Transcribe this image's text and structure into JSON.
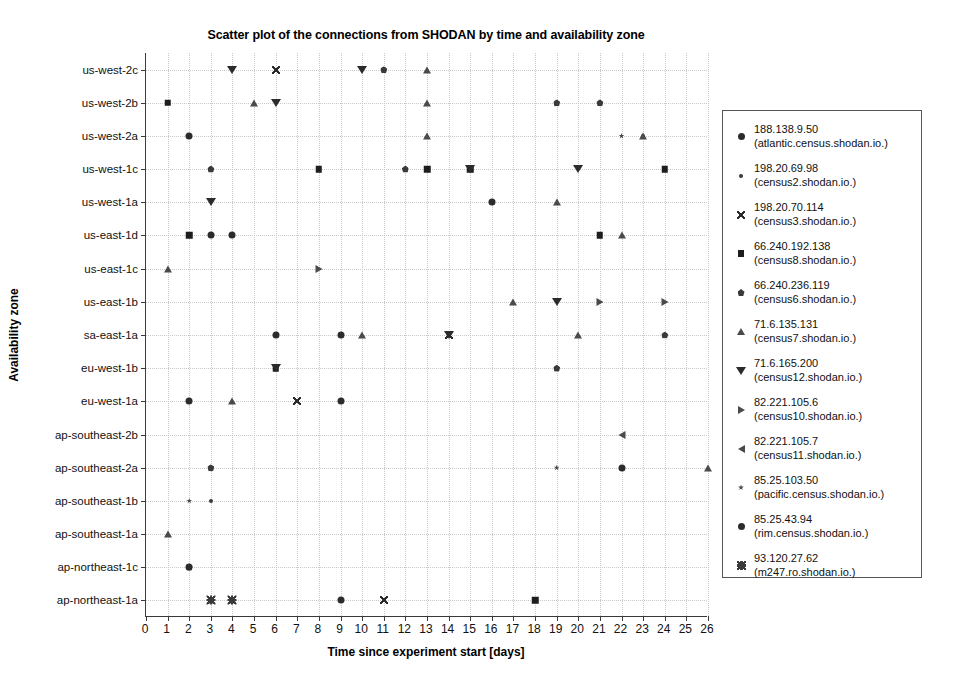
{
  "chart_data": {
    "type": "scatter",
    "title": "Scatter plot of the connections from SHODAN by time and availability zone",
    "xlabel": "Time since experiment start [days]",
    "ylabel": "Availability zone",
    "xlim": [
      0,
      26
    ],
    "xticks": [
      "0",
      "1",
      "2",
      "3",
      "4",
      "5",
      "6",
      "7",
      "8",
      "9",
      "10",
      "11",
      "12",
      "13",
      "14",
      "15",
      "16",
      "17",
      "18",
      "19",
      "20",
      "21",
      "22",
      "23",
      "24",
      "25",
      "26"
    ],
    "ycategories": [
      "us-west-2c",
      "us-west-2b",
      "us-west-2a",
      "us-west-1c",
      "us-west-1a",
      "us-east-1d",
      "us-east-1c",
      "us-east-1b",
      "sa-east-1a",
      "eu-west-1b",
      "eu-west-1a",
      "ap-southeast-2b",
      "ap-southeast-2a",
      "ap-southeast-1b",
      "ap-southeast-1a",
      "ap-northeast-1c",
      "ap-northeast-1a"
    ],
    "grid": true,
    "legend_position": "right-outside",
    "series": [
      {
        "name": "188.138.9.50",
        "host": "(atlantic.census.shodan.io.)",
        "marker": "circle",
        "points": [
          {
            "x": 2,
            "y": "us-west-2a"
          },
          {
            "x": 2,
            "y": "eu-west-1a"
          },
          {
            "x": 3,
            "y": "us-east-1d"
          },
          {
            "x": 4,
            "y": "us-east-1d"
          },
          {
            "x": 9,
            "y": "sa-east-1a"
          },
          {
            "x": 9,
            "y": "eu-west-1a"
          },
          {
            "x": 9,
            "y": "ap-northeast-1a"
          },
          {
            "x": 16,
            "y": "us-west-1a"
          },
          {
            "x": 22,
            "y": "ap-southeast-2a"
          }
        ]
      },
      {
        "name": "198.20.69.98",
        "host": "(census2.shodan.io.)",
        "marker": "dot-small",
        "points": [
          {
            "x": 3,
            "y": "ap-southeast-1b"
          },
          {
            "x": 23,
            "y": "us-west-2a"
          }
        ]
      },
      {
        "name": "198.20.70.114",
        "host": "(census3.shodan.io.)",
        "marker": "x",
        "points": [
          {
            "x": 6,
            "y": "us-west-2c"
          },
          {
            "x": 7,
            "y": "eu-west-1a"
          },
          {
            "x": 11,
            "y": "ap-northeast-1a"
          },
          {
            "x": 14,
            "y": "sa-east-1a"
          }
        ]
      },
      {
        "name": "66.240.192.138",
        "host": "(census8.shodan.io.)",
        "marker": "square",
        "points": [
          {
            "x": 1,
            "y": "us-west-2b"
          },
          {
            "x": 2,
            "y": "us-east-1d"
          },
          {
            "x": 6,
            "y": "eu-west-1b"
          },
          {
            "x": 8,
            "y": "us-west-1c"
          },
          {
            "x": 13,
            "y": "us-west-1c"
          },
          {
            "x": 15,
            "y": "us-west-1c"
          },
          {
            "x": 18,
            "y": "ap-northeast-1a"
          },
          {
            "x": 21,
            "y": "us-east-1d"
          },
          {
            "x": 24,
            "y": "us-west-1c"
          }
        ]
      },
      {
        "name": "66.240.236.119",
        "host": "(census6.shodan.io.)",
        "marker": "pentagon",
        "points": [
          {
            "x": 3,
            "y": "us-west-1c"
          },
          {
            "x": 2,
            "y": "ap-northeast-1c"
          },
          {
            "x": 3,
            "y": "ap-northeast-1a"
          },
          {
            "x": 4,
            "y": "ap-northeast-1a"
          },
          {
            "x": 3,
            "y": "ap-southeast-2a"
          },
          {
            "x": 11,
            "y": "us-west-2c"
          },
          {
            "x": 12,
            "y": "us-west-1c"
          },
          {
            "x": 19,
            "y": "eu-west-1b"
          },
          {
            "x": 19,
            "y": "us-west-2b"
          },
          {
            "x": 21,
            "y": "us-west-2b"
          },
          {
            "x": 24,
            "y": "sa-east-1a"
          }
        ]
      },
      {
        "name": "71.6.135.131",
        "host": "(census7.shodan.io.)",
        "marker": "triangle-up",
        "points": [
          {
            "x": 1,
            "y": "us-east-1c"
          },
          {
            "x": 1,
            "y": "ap-southeast-1a"
          },
          {
            "x": 4,
            "y": "eu-west-1a"
          },
          {
            "x": 5,
            "y": "us-west-2b"
          },
          {
            "x": 10,
            "y": "sa-east-1a"
          },
          {
            "x": 13,
            "y": "us-west-2c"
          },
          {
            "x": 13,
            "y": "us-west-2b"
          },
          {
            "x": 13,
            "y": "us-west-2a"
          },
          {
            "x": 17,
            "y": "us-east-1b"
          },
          {
            "x": 19,
            "y": "us-west-1a"
          },
          {
            "x": 20,
            "y": "sa-east-1a"
          },
          {
            "x": 22,
            "y": "us-east-1d"
          },
          {
            "x": 23,
            "y": "us-west-2a"
          },
          {
            "x": 26,
            "y": "ap-southeast-2a"
          }
        ]
      },
      {
        "name": "71.6.165.200",
        "host": "(census12.shodan.io.)",
        "marker": "triangle-down",
        "points": [
          {
            "x": 3,
            "y": "us-west-1a"
          },
          {
            "x": 4,
            "y": "us-west-2c"
          },
          {
            "x": 6,
            "y": "us-west-2b"
          },
          {
            "x": 6,
            "y": "eu-west-1b"
          },
          {
            "x": 10,
            "y": "us-west-2c"
          },
          {
            "x": 14,
            "y": "sa-east-1a"
          },
          {
            "x": 15,
            "y": "us-west-1c"
          },
          {
            "x": 19,
            "y": "us-east-1b"
          },
          {
            "x": 20,
            "y": "us-west-1c"
          }
        ]
      },
      {
        "name": "82.221.105.6",
        "host": "(census10.shodan.io.)",
        "marker": "triangle-right",
        "points": [
          {
            "x": 8,
            "y": "us-east-1c"
          },
          {
            "x": 24,
            "y": "us-east-1b"
          },
          {
            "x": 21,
            "y": "us-east-1b"
          }
        ]
      },
      {
        "name": "82.221.105.7",
        "host": "(census11.shodan.io.)",
        "marker": "triangle-left",
        "points": [
          {
            "x": 22,
            "y": "ap-southeast-2b"
          }
        ]
      },
      {
        "name": "85.25.103.50",
        "host": "(pacific.census.shodan.io.)",
        "marker": "star",
        "points": [
          {
            "x": 2,
            "y": "ap-southeast-1b"
          },
          {
            "x": 19,
            "y": "ap-southeast-2a"
          },
          {
            "x": 22,
            "y": "us-west-2a"
          }
        ]
      },
      {
        "name": "85.25.43.94",
        "host": "(rim.census.shodan.io.)",
        "marker": "dot",
        "points": [
          {
            "x": 2,
            "y": "ap-northeast-1c"
          },
          {
            "x": 6,
            "y": "sa-east-1a"
          }
        ]
      },
      {
        "name": "93.120.27.62",
        "host": "(m247.ro.shodan.io.)",
        "marker": "plus",
        "points": [
          {
            "x": 3,
            "y": "ap-northeast-1a"
          },
          {
            "x": 4,
            "y": "ap-northeast-1a"
          }
        ]
      }
    ]
  },
  "legend": {
    "entries": [
      {
        "name": "188.138.9.50",
        "host": "(atlantic.census.shodan.io.)",
        "marker": "circle"
      },
      {
        "name": "198.20.69.98",
        "host": "(census2.shodan.io.)",
        "marker": "dot-small"
      },
      {
        "name": "198.20.70.114",
        "host": "(census3.shodan.io.)",
        "marker": "x"
      },
      {
        "name": "66.240.192.138",
        "host": "(census8.shodan.io.)",
        "marker": "square"
      },
      {
        "name": "66.240.236.119",
        "host": "(census6.shodan.io.)",
        "marker": "pentagon"
      },
      {
        "name": "71.6.135.131",
        "host": "(census7.shodan.io.)",
        "marker": "triangle-up"
      },
      {
        "name": "71.6.165.200",
        "host": "(census12.shodan.io.)",
        "marker": "triangle-down"
      },
      {
        "name": "82.221.105.6",
        "host": "(census10.shodan.io.)",
        "marker": "triangle-right"
      },
      {
        "name": "82.221.105.7",
        "host": "(census11.shodan.io.)",
        "marker": "triangle-left"
      },
      {
        "name": "85.25.103.50",
        "host": "(pacific.census.shodan.io.)",
        "marker": "star"
      },
      {
        "name": "85.25.43.94",
        "host": "(rim.census.shodan.io.)",
        "marker": "dot"
      },
      {
        "name": "93.120.27.62",
        "host": "(m247.ro.shodan.io.)",
        "marker": "plus"
      }
    ]
  }
}
